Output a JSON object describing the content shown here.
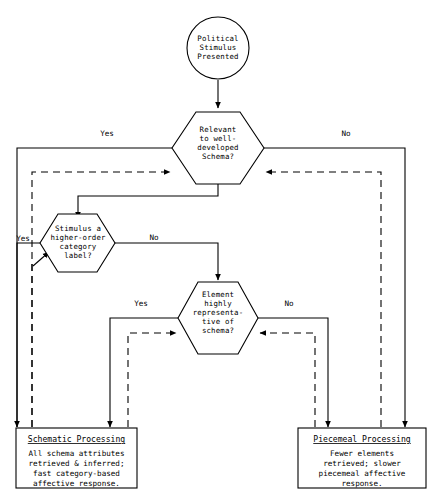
{
  "page": {
    "header_faint_text": "",
    "background_color": "#ffffff",
    "line_color": "#000000",
    "width": 429,
    "height": 499
  },
  "diagram": {
    "type": "flowchart",
    "start_node": {
      "id": "start",
      "shape": "circle",
      "lines": [
        "Political",
        "Stimulus",
        "Presented"
      ]
    },
    "decisions": [
      {
        "id": "decision-relevant-schema",
        "shape": "hexagon",
        "lines": [
          "Relevant",
          "to well-",
          "developed",
          "Schema?"
        ],
        "yes_label": "Yes",
        "no_label": "No"
      },
      {
        "id": "decision-higher-order-category",
        "shape": "hexagon",
        "lines": [
          "Stimulus a",
          "higher-order",
          "category",
          "label?"
        ],
        "yes_label": "Yes",
        "no_label": "No"
      },
      {
        "id": "decision-element-representative",
        "shape": "hexagon",
        "lines": [
          "Element",
          "highly",
          "representa-",
          "tive of",
          "schema?"
        ],
        "yes_label": "Yes",
        "no_label": "No"
      }
    ],
    "outcomes": [
      {
        "id": "outcome-schematic",
        "shape": "rectangle",
        "title": "Schematic Processing",
        "body_lines": [
          "All schema attributes",
          "retrieved & inferred;",
          "fast category-based",
          "affective response."
        ]
      },
      {
        "id": "outcome-piecemeal",
        "shape": "rectangle",
        "title": "Piecemeal Processing",
        "body_lines": [
          "Fewer elements",
          "retrieved; slower",
          "piecemeal affective",
          "response."
        ]
      }
    ],
    "edge_labels": {
      "d1_yes": "Yes",
      "d1_no": "No",
      "d2_yes": "Yes",
      "d2_no": "No",
      "d3_yes": "Yes",
      "d3_no": "No"
    }
  }
}
